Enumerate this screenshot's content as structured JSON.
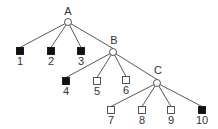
{
  "diagram": {
    "type": "tree",
    "colors": {
      "line": "#444444",
      "filled": "#111111",
      "empty_fill": "#ffffff",
      "text": "#333333"
    },
    "internal_nodes": [
      {
        "id": "A",
        "label": "A",
        "x": 68,
        "y": 22,
        "lx": 68,
        "ly": 15
      },
      {
        "id": "B",
        "label": "B",
        "x": 113,
        "y": 52,
        "lx": 114,
        "ly": 44
      },
      {
        "id": "C",
        "label": "C",
        "x": 157,
        "y": 83,
        "lx": 158,
        "ly": 74
      }
    ],
    "leaves": [
      {
        "id": "1",
        "label": "1",
        "x": 20,
        "y": 51,
        "filled": true
      },
      {
        "id": "2",
        "label": "2",
        "x": 51,
        "y": 51,
        "filled": true
      },
      {
        "id": "3",
        "label": "3",
        "x": 81,
        "y": 51,
        "filled": true
      },
      {
        "id": "4",
        "label": "4",
        "x": 66,
        "y": 81,
        "filled": true
      },
      {
        "id": "5",
        "label": "5",
        "x": 97,
        "y": 81,
        "filled": false
      },
      {
        "id": "6",
        "label": "6",
        "x": 126,
        "y": 80,
        "filled": false
      },
      {
        "id": "7",
        "label": "7",
        "x": 111,
        "y": 110,
        "filled": false
      },
      {
        "id": "8",
        "label": "8",
        "x": 142,
        "y": 110,
        "filled": false
      },
      {
        "id": "9",
        "label": "9",
        "x": 171,
        "y": 110,
        "filled": false
      },
      {
        "id": "10",
        "label": "10",
        "x": 202,
        "y": 110,
        "filled": true
      }
    ],
    "edges": [
      [
        "A",
        "1"
      ],
      [
        "A",
        "2"
      ],
      [
        "A",
        "3"
      ],
      [
        "A",
        "B"
      ],
      [
        "B",
        "4"
      ],
      [
        "B",
        "5"
      ],
      [
        "B",
        "6"
      ],
      [
        "B",
        "C"
      ],
      [
        "C",
        "7"
      ],
      [
        "C",
        "8"
      ],
      [
        "C",
        "9"
      ],
      [
        "C",
        "10"
      ]
    ]
  }
}
